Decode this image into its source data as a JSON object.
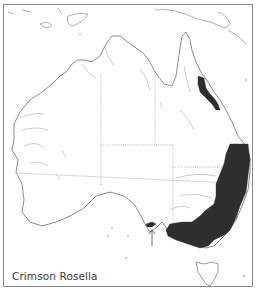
{
  "map": {
    "title": "Crimson Rosella",
    "region": "Australia",
    "legend": {
      "range_color": "#2e2e2e",
      "coast_color": "#6e6e6e",
      "border_color": "#8c8c8c",
      "background": "#ffffff"
    },
    "features": [
      {
        "name": "north-queensland-range",
        "description": "Shaded distribution along northeast Queensland coast"
      },
      {
        "name": "southeast-range",
        "description": "Shaded distribution from southeast Queensland through New South Wales to Victoria and southeastern South Australia"
      },
      {
        "name": "kangaroo-island-population",
        "description": "Isolated population indicated by arrow"
      }
    ],
    "arrow": {
      "label": "↑"
    }
  }
}
